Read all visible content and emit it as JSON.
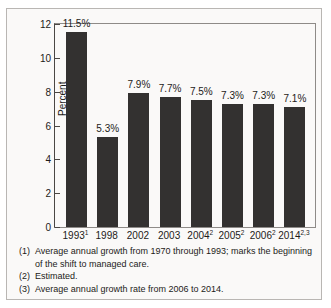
{
  "chart_data": {
    "type": "bar",
    "title": "",
    "xlabel": "",
    "ylabel": "Percent",
    "ylim": [
      0,
      12
    ],
    "yticks": [
      0,
      2,
      4,
      6,
      8,
      10,
      12
    ],
    "ytick_labels": [
      "0",
      "2",
      "4",
      "6",
      "8",
      "10",
      "12"
    ],
    "grid": false,
    "legend": "none",
    "categories": [
      "1993¹",
      "1998",
      "2002",
      "2003",
      "2004²",
      "2005²",
      "2006²",
      "2014²·³"
    ],
    "category_parts": [
      {
        "base": "1993",
        "sup": "1"
      },
      {
        "base": "1998",
        "sup": ""
      },
      {
        "base": "2002",
        "sup": ""
      },
      {
        "base": "2003",
        "sup": ""
      },
      {
        "base": "2004",
        "sup": "2"
      },
      {
        "base": "2005",
        "sup": "2"
      },
      {
        "base": "2006",
        "sup": "2"
      },
      {
        "base": "2014",
        "sup": "2,3"
      }
    ],
    "values": [
      11.5,
      5.3,
      7.9,
      7.7,
      7.5,
      7.3,
      7.3,
      7.1
    ],
    "data_labels": [
      "11.5%",
      "5.3%",
      "7.9%",
      "7.7%",
      "7.5%",
      "7.3%",
      "7.3%",
      "7.1%"
    ],
    "bar_color": "#333130"
  },
  "footnotes": [
    {
      "marker": "(1)",
      "text": "Average annual growth from 1970 through 1993; marks the beginning of the shift to managed care."
    },
    {
      "marker": "(2)",
      "text": "Estimated."
    },
    {
      "marker": "(3)",
      "text": "Average annual growth rate from 2006 to 2014."
    }
  ]
}
